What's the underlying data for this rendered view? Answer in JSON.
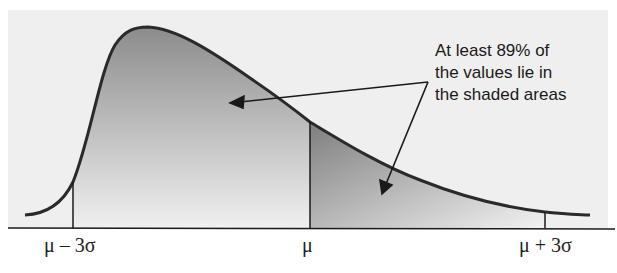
{
  "diagram": {
    "type": "right-skewed distribution with Chebyshev interval",
    "colors": {
      "background_panel": "#efefef",
      "shade_dark": "#8e8e8e",
      "shade_light": "#ececec",
      "curve": "#2a2a2a",
      "axis": "#1a1a1a"
    },
    "axis_labels": [
      {
        "id": "minus",
        "text": "μ – 3σ"
      },
      {
        "id": "mean",
        "text": "μ"
      },
      {
        "id": "plus",
        "text": "μ + 3σ"
      }
    ],
    "annotation": {
      "lines": [
        "At least 89% of",
        "the values lie in",
        "the shaded areas"
      ]
    }
  }
}
